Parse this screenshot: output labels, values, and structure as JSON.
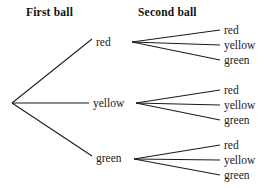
{
  "diagram": {
    "type": "tree-diagram",
    "title_first": "First ball",
    "title_second": "Second ball",
    "root": {
      "x": 12,
      "y": 103
    },
    "level1": [
      {
        "label": "red",
        "label_x": 96,
        "label_y": 36,
        "node_x": 132,
        "node_y": 42,
        "line_end_x": 92,
        "line_end_y": 39
      },
      {
        "label": "yellow",
        "label_x": 93,
        "label_y": 97,
        "node_x": 136,
        "node_y": 103,
        "line_end_x": 89,
        "line_end_y": 103
      },
      {
        "label": "green",
        "label_x": 96,
        "label_y": 152,
        "node_x": 134,
        "node_y": 159,
        "line_end_x": 92,
        "line_end_y": 156
      }
    ],
    "level2_labels": [
      "red",
      "yellow",
      "green"
    ],
    "level2_groups": [
      {
        "parent": "red",
        "ys": [
          24,
          39,
          54
        ]
      },
      {
        "parent": "yellow",
        "ys": [
          84,
          99,
          114
        ]
      },
      {
        "parent": "green",
        "ys": [
          139,
          154,
          169
        ]
      }
    ],
    "colors": {
      "background": "#ffffff",
      "line": "#1b1b1b",
      "text": "#1a1a1a",
      "heading": "#111111"
    }
  }
}
